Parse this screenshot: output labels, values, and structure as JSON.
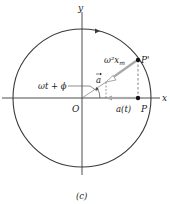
{
  "figure": {
    "caption": "(c)",
    "colors": {
      "circle": "#3a3a3a",
      "axes": "#3a3a3a",
      "vector": "#a8a8a8",
      "dashed": "#555555",
      "point": "#111111"
    }
  },
  "axes": {
    "x_label": "x",
    "y_label": "y",
    "origin_label": "O"
  },
  "points": {
    "p_prime_label": "P'",
    "p_label": "P"
  },
  "labels": {
    "magnitude": "ω²x",
    "magnitude_sub": "m",
    "vector": "a",
    "angle": "ωt + ϕ",
    "projection": "a(t)"
  },
  "icons": {
    "direction_arrow": "circle-direction-arrow-icon",
    "vector_arrowhead": "open-triangle-arrowhead-icon"
  }
}
